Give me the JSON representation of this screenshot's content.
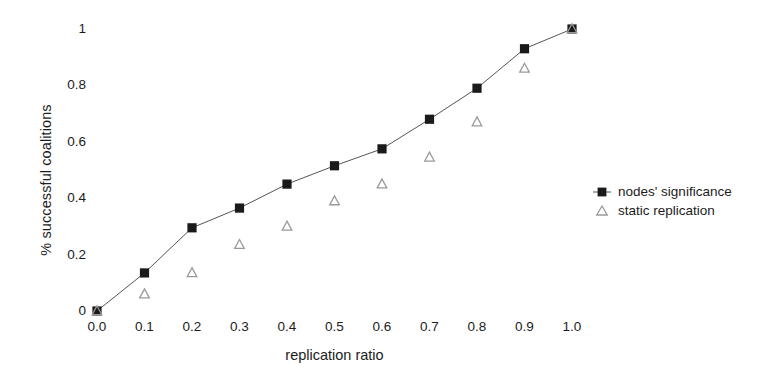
{
  "chart_data": {
    "type": "scatter",
    "title": "",
    "xlabel": "replication ratio",
    "ylabel": "% successful coalitions",
    "x": [
      0.0,
      0.1,
      0.2,
      0.3,
      0.4,
      0.5,
      0.6,
      0.7,
      0.8,
      0.9,
      1.0
    ],
    "xticklabels": [
      "0.0",
      "0.1",
      "0.2",
      "0.3",
      "0.4",
      "0.5",
      "0.6",
      "0.7",
      "0.8",
      "0.9",
      "1.0"
    ],
    "yticks": [
      0,
      0.2,
      0.4,
      0.6,
      0.8,
      1
    ],
    "yticklabels": [
      "0",
      "0.2",
      "0.4",
      "0.6",
      "0.8",
      "1"
    ],
    "xlim": [
      0.0,
      1.0
    ],
    "ylim": [
      0.0,
      1.0
    ],
    "grid": false,
    "legend_position": "right",
    "series": [
      {
        "name": "nodes' significance",
        "marker": "filled-square",
        "color": "#1a1a1a",
        "line": true,
        "values": [
          0.0,
          0.135,
          0.295,
          0.365,
          0.45,
          0.515,
          0.575,
          0.68,
          0.79,
          0.93,
          1.0
        ]
      },
      {
        "name": "static replication",
        "marker": "open-triangle",
        "color": "#9a9a9a",
        "line": false,
        "values": [
          0.0,
          0.06,
          0.135,
          0.235,
          0.3,
          0.39,
          0.45,
          0.545,
          0.67,
          0.86,
          1.0
        ]
      }
    ]
  },
  "legend": {
    "items": [
      {
        "label": "nodes' significance",
        "marker": "filled-square-line-icon"
      },
      {
        "label": "static replication",
        "marker": "open-triangle-icon"
      }
    ]
  },
  "colors": {
    "background": "#ffffff",
    "text": "#1a1a1a",
    "series_1": "#1a1a1a",
    "series_2": "#9a9a9a",
    "line": "#555555"
  }
}
